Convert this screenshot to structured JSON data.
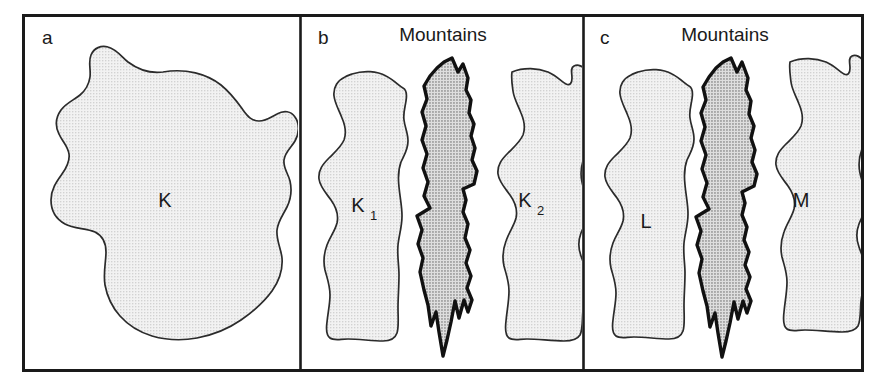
{
  "figure": {
    "caption_panels": [
      "a",
      "b",
      "c"
    ],
    "background_color": "#ffffff",
    "frame_color": "#1a1a1a",
    "fill_light": "#e8e8e8",
    "fill_dark": "#c2c2c2",
    "outline_color": "#2b2b2b",
    "barrier_outline_color": "#111111"
  },
  "panels": [
    {
      "id": "a",
      "label": "a",
      "title": "",
      "regions": [
        {
          "name": "K",
          "label": "K",
          "subscript": "",
          "fill": "light"
        }
      ]
    },
    {
      "id": "b",
      "label": "b",
      "title": "Mountains",
      "regions": [
        {
          "name": "K1",
          "label": "K",
          "subscript": "1",
          "fill": "light"
        },
        {
          "name": "barrier",
          "label": "",
          "subscript": "",
          "fill": "dark"
        },
        {
          "name": "K2",
          "label": "K",
          "subscript": "2",
          "fill": "light"
        }
      ]
    },
    {
      "id": "c",
      "label": "c",
      "title": "Mountains",
      "regions": [
        {
          "name": "L",
          "label": "L",
          "subscript": "",
          "fill": "light"
        },
        {
          "name": "barrier",
          "label": "",
          "subscript": "",
          "fill": "dark"
        },
        {
          "name": "M",
          "label": "M",
          "subscript": "",
          "fill": "light"
        }
      ]
    }
  ]
}
